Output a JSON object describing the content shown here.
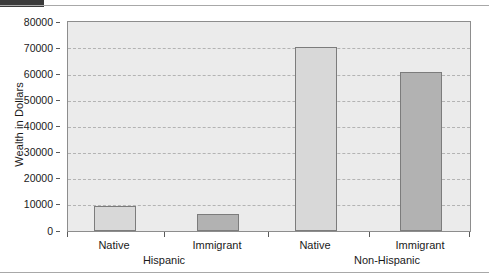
{
  "chart_data": {
    "type": "bar",
    "title": "",
    "xlabel": "",
    "ylabel": "Wealth in Dollars",
    "ylim": [
      0,
      80000
    ],
    "yticks": [
      0,
      10000,
      20000,
      30000,
      40000,
      50000,
      60000,
      70000,
      80000
    ],
    "ytick_labels": [
      "0",
      "10000",
      "20000",
      "30000",
      "40000",
      "50000",
      "60000",
      "70000",
      "80000"
    ],
    "grid": true,
    "legend": "none",
    "categories": [
      "Native",
      "Immigrant",
      "Native",
      "Immigrant"
    ],
    "groups": [
      {
        "label": "Hispanic",
        "categories": [
          "Native",
          "Immigrant"
        ]
      },
      {
        "label": "Non-Hispanic",
        "categories": [
          "Native",
          "Immigrant"
        ]
      }
    ],
    "values": [
      9700,
      6400,
      70500,
      61000
    ],
    "bars": [
      {
        "group": "Hispanic",
        "category": "Native",
        "value": 9700,
        "color": "#d8d8d8"
      },
      {
        "group": "Hispanic",
        "category": "Immigrant",
        "value": 6400,
        "color": "#b2b2b2"
      },
      {
        "group": "Non-Hispanic",
        "category": "Native",
        "value": 70500,
        "color": "#d8d8d8"
      },
      {
        "group": "Non-Hispanic",
        "category": "Immigrant",
        "value": 61000,
        "color": "#b2b2b2"
      }
    ],
    "colors": {
      "native_bar": "#d8d8d8",
      "immigrant_bar": "#b2b2b2",
      "plot_background": "#ebebeb",
      "gridline": "#b3b3b3",
      "axis": "#8d8d8d"
    }
  },
  "axis": {
    "y_title": "Wealth in Dollars",
    "y_tick_labels": [
      "80000",
      "70000",
      "60000",
      "50000",
      "40000",
      "30000",
      "20000",
      "10000",
      "0"
    ],
    "x_category_labels": [
      "Native",
      "Immigrant",
      "Native",
      "Immigrant"
    ],
    "x_group_labels": [
      "Hispanic",
      "Non-Hispanic"
    ]
  }
}
